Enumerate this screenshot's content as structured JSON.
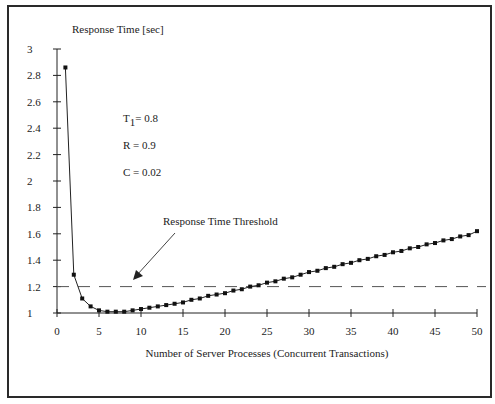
{
  "chart_data": {
    "type": "line",
    "title": "",
    "ylabel": "Response Time [sec]",
    "xlabel": "Number of Server Processes (Concurrent Transactions)",
    "xlim": [
      0,
      50
    ],
    "ylim": [
      1,
      3
    ],
    "x_ticks": [
      0,
      5,
      10,
      15,
      20,
      25,
      30,
      35,
      40,
      45,
      50
    ],
    "y_ticks": [
      1,
      1.2,
      1.4,
      1.6,
      1.8,
      2,
      2.2,
      2.4,
      2.6,
      2.8,
      3
    ],
    "y_tick_labels": [
      "1",
      "1.2",
      "1.4",
      "1.6",
      "1.8",
      "2",
      "2.2",
      "2.4",
      "2.6",
      "2.8",
      "3"
    ],
    "grid": false,
    "series": [
      {
        "name": "Response Time",
        "marker": "square",
        "x": [
          1,
          2,
          3,
          4,
          5,
          6,
          7,
          8,
          9,
          10,
          11,
          12,
          13,
          14,
          15,
          16,
          17,
          18,
          19,
          20,
          21,
          22,
          23,
          24,
          25,
          26,
          27,
          28,
          29,
          30,
          31,
          32,
          33,
          34,
          35,
          36,
          37,
          38,
          39,
          40,
          41,
          42,
          43,
          44,
          45,
          46,
          47,
          48,
          49,
          50
        ],
        "values": [
          2.86,
          1.29,
          1.11,
          1.05,
          1.02,
          1.01,
          1.01,
          1.01,
          1.02,
          1.03,
          1.04,
          1.05,
          1.06,
          1.07,
          1.08,
          1.1,
          1.11,
          1.13,
          1.14,
          1.15,
          1.17,
          1.18,
          1.2,
          1.21,
          1.23,
          1.24,
          1.26,
          1.27,
          1.29,
          1.31,
          1.32,
          1.34,
          1.35,
          1.37,
          1.38,
          1.4,
          1.41,
          1.43,
          1.44,
          1.46,
          1.47,
          1.49,
          1.5,
          1.52,
          1.53,
          1.55,
          1.56,
          1.58,
          1.59,
          1.62
        ]
      }
    ],
    "threshold": {
      "label": "Response Time Threshold",
      "value": 1.2,
      "style": "dashed"
    },
    "annotations": [
      {
        "text": "T",
        "sub": "1",
        "rest": "= 0.8"
      },
      {
        "text": "R  = 0.9"
      },
      {
        "text": "C  = 0.02"
      }
    ]
  }
}
